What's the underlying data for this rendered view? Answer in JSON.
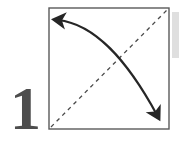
{
  "figure": {
    "kind": "origami-fold-instruction-diagram",
    "step_number": "1",
    "canvas": {
      "width": 179,
      "height": 143
    },
    "background_color": "#ffffff"
  },
  "paper_square": {
    "label": "paper-square",
    "x": 49,
    "y": 8,
    "width": 120,
    "height": 121,
    "stroke_color": "#5a5a5a",
    "stroke_width": 1.4,
    "fill_color": "#ffffff"
  },
  "fold_line": {
    "label": "valley-fold-diagonal",
    "from": {
      "x": 51,
      "y": 127
    },
    "to": {
      "x": 167,
      "y": 10
    },
    "style": "dashed",
    "dash_pattern": "4 4",
    "stroke_color": "#4a4a4a",
    "stroke_width": 1.3
  },
  "fold_arrow": {
    "label": "fold-motion-arrow",
    "path": "M 56,19 C 92,22 126,58 159,118",
    "stroke_color": "#262626",
    "stroke_width": 2.2,
    "head_start": {
      "x": 56,
      "y": 19,
      "direction": "up-left"
    },
    "head_end": {
      "x": 160,
      "y": 122,
      "direction": "down"
    }
  },
  "step_number": {
    "label": "step-number-one",
    "value": "1",
    "x": 10,
    "y": 129,
    "color": "#4d4d4d"
  },
  "edge_strip": {
    "label": "page-edge-shadow-strip",
    "x": 172,
    "y": 12,
    "width": 7,
    "height": 46,
    "color": "#d9d9d9"
  }
}
